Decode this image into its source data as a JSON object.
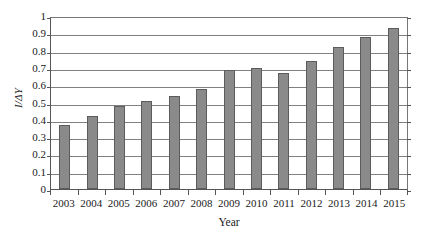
{
  "chart_data": {
    "type": "bar",
    "title": "",
    "xlabel": "Year",
    "ylabel": "I/ΔY",
    "categories": [
      "2003",
      "2004",
      "2005",
      "2006",
      "2007",
      "2008",
      "2009",
      "2010",
      "2011",
      "2012",
      "2013",
      "2014",
      "2015"
    ],
    "values": [
      0.37,
      0.42,
      0.48,
      0.51,
      0.54,
      0.58,
      0.69,
      0.7,
      0.67,
      0.74,
      0.82,
      0.88,
      0.93
    ],
    "series": [
      {
        "name": "I/ΔY",
        "values": [
          0.37,
          0.42,
          0.48,
          0.51,
          0.54,
          0.58,
          0.69,
          0.7,
          0.67,
          0.74,
          0.82,
          0.88,
          0.93
        ]
      }
    ],
    "ylim": [
      0,
      1
    ],
    "xlim_categories": 13,
    "yticks": [
      0,
      0.1,
      0.2,
      0.3,
      0.4,
      0.5,
      0.6,
      0.7,
      0.8,
      0.9,
      1
    ],
    "ytick_labels": [
      "0",
      "0.1",
      "0.2",
      "0.3",
      "0.4",
      "0.5",
      "0.6",
      "0.7",
      "0.8",
      "0.9",
      "1"
    ],
    "grid": "horizontal",
    "legend": "none",
    "colors": {
      "bar_fill": "#8a8a8a",
      "bar_border": "#5c5c5c",
      "gridline": "#808080",
      "axis": "#555555",
      "background": "#ffffff",
      "text": "#1a1a1a"
    }
  }
}
